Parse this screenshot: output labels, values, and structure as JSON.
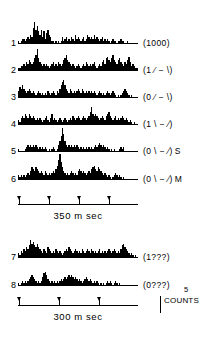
{
  "figure": {
    "type": "psth-histogram-panel",
    "background": "#ffffff",
    "ink": "#000000"
  },
  "axes": [
    {
      "id": "axis-350",
      "label": "350 m sec",
      "duration_ms": 350,
      "tick_positions_pct": [
        1,
        26,
        51,
        76
      ],
      "tick_count": 4
    },
    {
      "id": "axis-300",
      "label": "300 m sec",
      "duration_ms": 300,
      "tick_positions_pct": [
        1,
        34,
        67
      ],
      "tick_count": 3
    }
  ],
  "scale_bar": {
    "value": "5",
    "unit": "COUNTS"
  },
  "chart_data": {
    "type": "bar",
    "title": "",
    "subtitle": "",
    "xlabel": "350 m sec / 300 m sec",
    "ylabel": "COUNTS",
    "ylim": [
      0,
      14
    ],
    "grid": false,
    "legend_position": "right",
    "scale_bar_counts": 5,
    "x_axis_groups": [
      {
        "name": "350 m sec",
        "applies_to_rows": [
          1,
          2,
          3,
          4,
          5,
          6
        ],
        "duration_ms": 350,
        "tick_count": 4
      },
      {
        "name": "300 m sec",
        "applies_to_rows": [
          7,
          8
        ],
        "duration_ms": 300,
        "tick_count": 3
      }
    ],
    "series": [
      {
        "name": "1",
        "row_number": "1",
        "condition": "(1000)",
        "suffix": "",
        "values": [
          1,
          0,
          1,
          2,
          2,
          1,
          2,
          3,
          2,
          4,
          3,
          8,
          11,
          7,
          9,
          6,
          4,
          7,
          3,
          6,
          2,
          5,
          7,
          4,
          3,
          1,
          1,
          0,
          1,
          0,
          1,
          0,
          1,
          3,
          1,
          2,
          3,
          1,
          2,
          1,
          3,
          2,
          1,
          4,
          2,
          3,
          2,
          1,
          2,
          3,
          1,
          2,
          4,
          3,
          2,
          3,
          2,
          4,
          2,
          3,
          2,
          1,
          2,
          3,
          1,
          2,
          1,
          2,
          1,
          0,
          1,
          2,
          1,
          1,
          0,
          1,
          1,
          2,
          1,
          1,
          0,
          0,
          1,
          0,
          0,
          0,
          0,
          0,
          0,
          0
        ]
      },
      {
        "name": "2",
        "row_number": "2",
        "condition": "(1 ⁄ − \\)",
        "suffix": "",
        "values": [
          1,
          1,
          2,
          2,
          3,
          2,
          4,
          3,
          5,
          4,
          3,
          4,
          6,
          8,
          11,
          6,
          4,
          3,
          2,
          3,
          2,
          3,
          2,
          1,
          2,
          3,
          4,
          2,
          3,
          2,
          4,
          3,
          2,
          3,
          5,
          6,
          8,
          5,
          4,
          3,
          2,
          3,
          2,
          1,
          2,
          3,
          2,
          1,
          2,
          3,
          2,
          4,
          3,
          2,
          3,
          2,
          3,
          4,
          2,
          1,
          2,
          3,
          2,
          4,
          5,
          3,
          6,
          7,
          5,
          4,
          6,
          8,
          5,
          4,
          3,
          5,
          6,
          4,
          3,
          2,
          4,
          3,
          5,
          7,
          4,
          2,
          3,
          2,
          1,
          1
        ]
      },
      {
        "name": "3",
        "row_number": "3",
        "condition": "(0 ⁄ − \\)",
        "suffix": "",
        "values": [
          3,
          5,
          4,
          6,
          4,
          3,
          2,
          3,
          4,
          3,
          2,
          3,
          2,
          1,
          2,
          3,
          2,
          1,
          2,
          1,
          2,
          1,
          3,
          2,
          1,
          2,
          3,
          2,
          1,
          3,
          2,
          4,
          6,
          8,
          9,
          6,
          4,
          3,
          2,
          4,
          3,
          2,
          3,
          2,
          3,
          4,
          3,
          2,
          4,
          3,
          2,
          3,
          2,
          3,
          2,
          3,
          2,
          3,
          2,
          1,
          2,
          3,
          2,
          1,
          2,
          1,
          2,
          3,
          2,
          1,
          2,
          3,
          2,
          1,
          0,
          1,
          0,
          1,
          2,
          3,
          4,
          3,
          2,
          1,
          0,
          1,
          0,
          0,
          0,
          0
        ]
      },
      {
        "name": "4",
        "row_number": "4",
        "condition": "(1 \\ − ⁄)",
        "suffix": "",
        "values": [
          2,
          1,
          3,
          4,
          3,
          5,
          4,
          3,
          5,
          4,
          3,
          4,
          3,
          2,
          3,
          2,
          3,
          2,
          1,
          2,
          3,
          4,
          2,
          1,
          3,
          5,
          2,
          3,
          2,
          1,
          2,
          3,
          2,
          1,
          2,
          3,
          2,
          1,
          2,
          3,
          2,
          4,
          3,
          2,
          3,
          4,
          3,
          2,
          3,
          4,
          3,
          2,
          3,
          4,
          6,
          9,
          5,
          4,
          5,
          4,
          3,
          2,
          3,
          4,
          3,
          2,
          4,
          5,
          6,
          4,
          3,
          2,
          3,
          4,
          2,
          3,
          2,
          3,
          4,
          3,
          2,
          3,
          2,
          1,
          2,
          1,
          0,
          1,
          0,
          0
        ]
      },
      {
        "name": "5",
        "row_number": "5",
        "condition": "(0 \\ − ⁄)",
        "suffix": "S",
        "values": [
          1,
          0,
          0,
          0,
          0,
          1,
          2,
          3,
          2,
          3,
          2,
          3,
          2,
          3,
          2,
          1,
          2,
          1,
          2,
          1,
          2,
          1,
          0,
          1,
          0,
          1,
          2,
          1,
          0,
          1,
          3,
          5,
          8,
          12,
          9,
          5,
          3,
          2,
          3,
          2,
          3,
          2,
          3,
          2,
          3,
          2,
          1,
          2,
          1,
          2,
          1,
          2,
          1,
          2,
          1,
          2,
          1,
          2,
          3,
          2,
          3,
          4,
          3,
          2,
          3,
          2,
          1,
          2,
          1,
          0,
          1,
          0,
          1,
          0,
          0,
          0,
          1,
          2,
          1,
          2,
          0,
          0,
          0,
          0,
          0,
          0,
          0,
          0,
          0,
          0
        ]
      },
      {
        "name": "6",
        "row_number": "6",
        "condition": "(0 \\ − ⁄)",
        "suffix": "M",
        "values": [
          2,
          1,
          2,
          1,
          2,
          1,
          2,
          3,
          2,
          4,
          6,
          5,
          4,
          6,
          5,
          4,
          3,
          4,
          3,
          2,
          4,
          3,
          2,
          3,
          2,
          3,
          4,
          3,
          5,
          7,
          10,
          13,
          9,
          6,
          4,
          3,
          2,
          3,
          2,
          3,
          4,
          3,
          2,
          3,
          2,
          4,
          5,
          4,
          3,
          4,
          3,
          2,
          3,
          4,
          3,
          5,
          6,
          7,
          5,
          4,
          6,
          5,
          4,
          3,
          2,
          3,
          2,
          1,
          2,
          1,
          0,
          1,
          2,
          3,
          2,
          1,
          2,
          1,
          0,
          1,
          0,
          0,
          0,
          0,
          0,
          0,
          0,
          0,
          0,
          0
        ]
      },
      {
        "name": "7",
        "row_number": "7",
        "condition": "(1???)",
        "suffix": "",
        "values": [
          2,
          1,
          3,
          2,
          4,
          3,
          5,
          4,
          6,
          9,
          7,
          8,
          6,
          5,
          7,
          5,
          4,
          3,
          2,
          4,
          3,
          2,
          5,
          4,
          3,
          2,
          3,
          2,
          4,
          3,
          2,
          3,
          2,
          1,
          2,
          3,
          4,
          3,
          5,
          4,
          3,
          2,
          3,
          4,
          3,
          2,
          3,
          2,
          4,
          3,
          2,
          3,
          4,
          3,
          2,
          4,
          3,
          2,
          3,
          2,
          3,
          4,
          2,
          3,
          2,
          3,
          2,
          3,
          4,
          3,
          2,
          3,
          4,
          3,
          2,
          3,
          2,
          4,
          6,
          7,
          5,
          4,
          3,
          2,
          1,
          2,
          1,
          0,
          1,
          0
        ]
      },
      {
        "name": "8",
        "row_number": "8",
        "condition": "(0???)",
        "suffix": "",
        "values": [
          1,
          0,
          1,
          2,
          1,
          2,
          1,
          2,
          3,
          4,
          5,
          4,
          3,
          2,
          1,
          2,
          1,
          2,
          4,
          6,
          7,
          5,
          3,
          2,
          1,
          2,
          1,
          2,
          1,
          2,
          1,
          2,
          3,
          2,
          3,
          4,
          3,
          4,
          5,
          4,
          5,
          4,
          3,
          4,
          3,
          2,
          3,
          2,
          1,
          2,
          3,
          4,
          3,
          2,
          3,
          2,
          1,
          2,
          1,
          2,
          1,
          0,
          1,
          0,
          1,
          0,
          1,
          2,
          1,
          2,
          1,
          0,
          1,
          2,
          1,
          0,
          1,
          0,
          0,
          0,
          0,
          0,
          0,
          0,
          0,
          0,
          0,
          0,
          0,
          0
        ]
      }
    ]
  }
}
